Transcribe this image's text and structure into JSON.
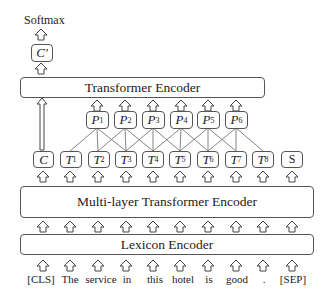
{
  "output": {
    "label": "Softmax"
  },
  "c_prime": {
    "label": "C′"
  },
  "top_encoder": {
    "label": "Transformer Encoder"
  },
  "phrase_nodes": [
    {
      "label": "P",
      "sub": "1"
    },
    {
      "label": "P",
      "sub": "2"
    },
    {
      "label": "P",
      "sub": "3"
    },
    {
      "label": "P",
      "sub": "4"
    },
    {
      "label": "P",
      "sub": "5"
    },
    {
      "label": "P",
      "sub": "6"
    }
  ],
  "token_nodes": [
    {
      "label": "C",
      "sub": ""
    },
    {
      "label": "T",
      "sub": "1"
    },
    {
      "label": "T",
      "sub": "2"
    },
    {
      "label": "T",
      "sub": "3"
    },
    {
      "label": "T",
      "sub": "4"
    },
    {
      "label": "T",
      "sub": "5"
    },
    {
      "label": "T",
      "sub": "6"
    },
    {
      "label": "T",
      "sub": "7"
    },
    {
      "label": "T",
      "sub": "8"
    },
    {
      "label": "S",
      "sub": ""
    }
  ],
  "middle_encoder": {
    "label": "Multi-layer Transformer Encoder"
  },
  "lexicon_encoder": {
    "label": "Lexicon Encoder"
  },
  "input_words": [
    "[CLS]",
    "The",
    "service",
    "in",
    "this",
    "hotel",
    "is",
    "good",
    ".",
    "[SEP]"
  ]
}
